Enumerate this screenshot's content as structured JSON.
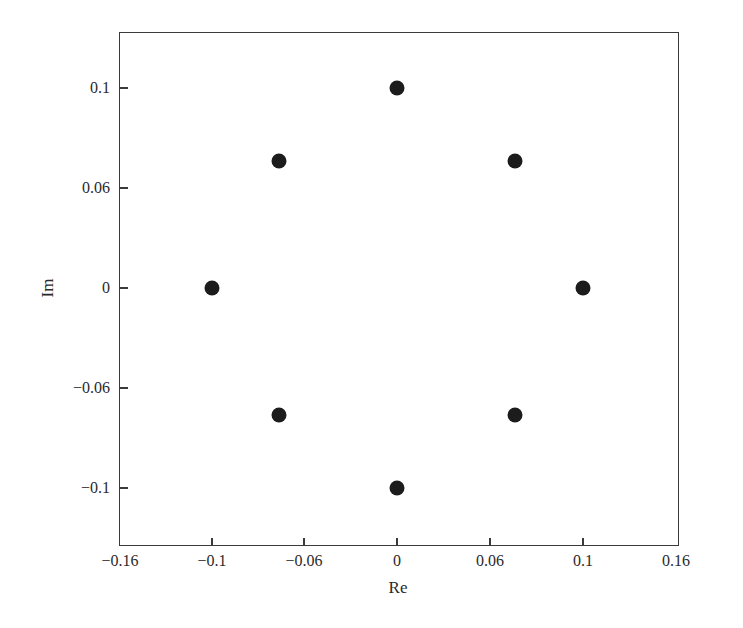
{
  "chart_data": {
    "type": "scatter",
    "title": "",
    "xlabel": "Re",
    "ylabel": "Im",
    "xlim": [
      -0.16,
      0.16
    ],
    "ylim": [
      -0.13,
      0.13
    ],
    "grid": false,
    "legend": null,
    "x_ticks": [
      {
        "label": "−0.16",
        "value": -0.16
      },
      {
        "label": "−0.1",
        "value": -0.1
      },
      {
        "label": "−0.06",
        "value": -0.06
      },
      {
        "label": "0",
        "value": 0
      },
      {
        "label": "0.06",
        "value": 0.06
      },
      {
        "label": "0.1",
        "value": 0.1
      },
      {
        "label": "0.16",
        "value": 0.16
      }
    ],
    "y_ticks": [
      {
        "label": "0.1",
        "value": 0.1
      },
      {
        "label": "0.06",
        "value": 0.06
      },
      {
        "label": "0",
        "value": 0
      },
      {
        "label": "−0.06",
        "value": -0.06
      },
      {
        "label": "−0.1",
        "value": -0.1
      }
    ],
    "series": [
      {
        "name": "points",
        "marker": "filled-circle",
        "color": "#1c1c1c",
        "x": [
          0.0,
          0.0707,
          0.1,
          0.0707,
          0.0,
          -0.0707,
          -0.1,
          -0.0707
        ],
        "y": [
          0.1,
          0.0707,
          0.0,
          -0.0707,
          -0.1,
          -0.0707,
          0.0,
          0.0707
        ]
      }
    ]
  },
  "layout": {
    "frame_px": {
      "left": 119,
      "top": 32,
      "right": 679,
      "bottom": 546
    },
    "x_tick_px": [
      120,
      212,
      304,
      397,
      490,
      583,
      676
    ],
    "y_tick_px": [
      88,
      188,
      288,
      388,
      488
    ],
    "y_top_px_value": 0.13,
    "y_bottom_px_value": -0.13
  }
}
